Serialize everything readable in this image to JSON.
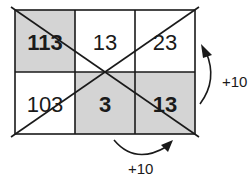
{
  "grid": {
    "rows": [
      [
        {
          "value": "113",
          "shaded": true,
          "bold": true
        },
        {
          "value": "13",
          "shaded": false,
          "bold": false
        },
        {
          "value": "23",
          "shaded": false,
          "bold": false
        }
      ],
      [
        {
          "value": "103",
          "shaded": false,
          "bold": false
        },
        {
          "value": "3",
          "shaded": true,
          "bold": true
        },
        {
          "value": "13",
          "shaded": true,
          "bold": true
        }
      ]
    ],
    "shade_color": "#d4d4d4",
    "line_color": "#1a1a1a"
  },
  "annotations": {
    "right_arrow_label": "+10",
    "bottom_arrow_label": "+10"
  }
}
